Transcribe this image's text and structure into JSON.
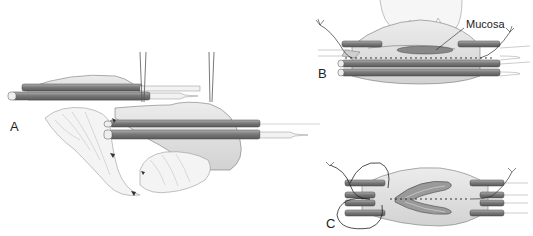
{
  "figure": {
    "panels": [
      {
        "id": "A",
        "label": "A",
        "description": "Two stapler cartridges positioned across tissue with traction sutures and mucosal folds"
      },
      {
        "id": "B",
        "label": "B",
        "description": "Stapler jaws closed over tissue with staple line; mucosa annotated",
        "annotation": "Mucosa"
      },
      {
        "id": "C",
        "label": "C",
        "description": "Opened anastomosis with staple line and traction sutures"
      }
    ]
  },
  "colors": {
    "tissue": "#e0e0e0",
    "instrument": "#8a8a8a",
    "instrument_dark": "#6a6a6a",
    "line": "#333333"
  }
}
